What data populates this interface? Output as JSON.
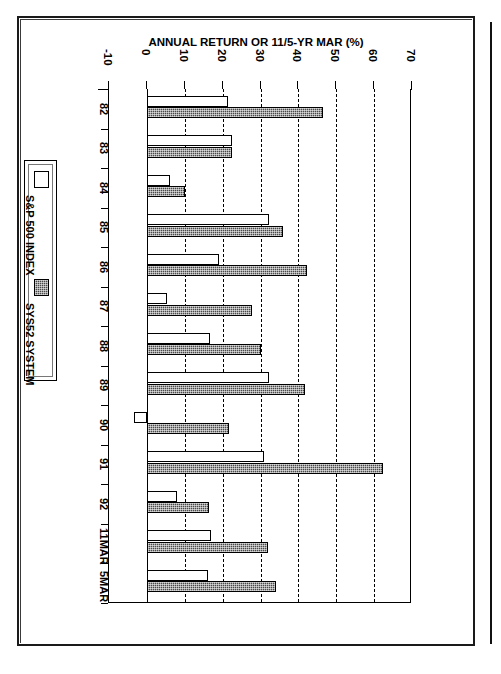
{
  "page": {
    "background": "#ffffff",
    "ink": "#000000"
  },
  "chart_data": {
    "type": "bar",
    "orientation": "horizontal-rotated",
    "title": "ANNUAL RETURNS (82-92) & 11/5-YR MAR INVESTMENT SYSTEM 52 VS S&P 500 INDEX",
    "title_lines": [
      "ANNUAL RETURNS (82-92) & 11/5-YR MAR",
      "INVESTMENT SYSTEM 52 VS S&P 500 INDEX"
    ],
    "xlabel": "ANNUAL RETURN OR 11/5-YR MAR (%)",
    "ylabel": "",
    "value_axis_title": "ANNUAL RETURN OR 11/5-YR MAR (%)",
    "xlim": [
      -10,
      70
    ],
    "xticks": [
      -10,
      0,
      10,
      20,
      30,
      40,
      50,
      60,
      70
    ],
    "xtick_labels": [
      "-10",
      "0",
      "10",
      "20",
      "30",
      "40",
      "50",
      "60",
      "70"
    ],
    "grid": true,
    "grid_style": "dashed-vertical",
    "legend_position": "left",
    "categories": [
      "82",
      "83",
      "84",
      "85",
      "86",
      "87",
      "88",
      "89",
      "90",
      "91",
      "92",
      "11MAR",
      "5MAR"
    ],
    "series": [
      {
        "name": "S&P 500 INDEX",
        "color": "#ffffff",
        "fill": "open",
        "values": [
          21.3,
          22.6,
          6.1,
          32.2,
          19.0,
          5.4,
          16.7,
          32.2,
          -3.5,
          30.9,
          8.0,
          16.8,
          16.1
        ]
      },
      {
        "name": "SYS52 SYSTEM",
        "color": "#4a4a4a",
        "fill": "dithered",
        "values": [
          46.5,
          22.4,
          10.0,
          35.9,
          42.3,
          27.8,
          30.0,
          41.7,
          21.6,
          62.4,
          16.5,
          31.9,
          34.1
        ]
      }
    ]
  },
  "legend": {
    "entries": [
      {
        "label": "S&P 500 INDEX",
        "swatch": "open-square-swatch"
      },
      {
        "label": "SYS52 SYSTEM",
        "swatch": "filled-square-swatch"
      }
    ]
  }
}
